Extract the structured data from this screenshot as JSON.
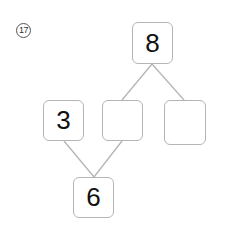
{
  "problem": {
    "number": "17"
  },
  "diagram": {
    "type": "number-bond",
    "top": {
      "value": "8"
    },
    "middle_row": [
      {
        "value": "3"
      },
      {
        "value": ""
      },
      {
        "value": ""
      }
    ],
    "bottom": {
      "value": "6"
    },
    "colors": {
      "box_border": "#b5b5b5",
      "line": "#b5b5b5",
      "text": "#111111"
    }
  }
}
